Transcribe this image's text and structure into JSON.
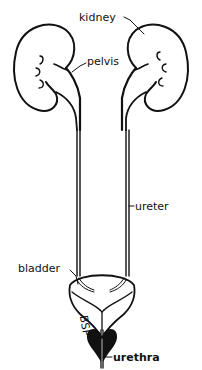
{
  "diagram": {
    "labels": {
      "kidney": "kidney",
      "pelvis": "pelvis",
      "ureter": "ureter",
      "bladder": "bladder",
      "urethra": "urethra"
    },
    "colors": {
      "ink": "#111111",
      "background": "#ffffff"
    }
  }
}
